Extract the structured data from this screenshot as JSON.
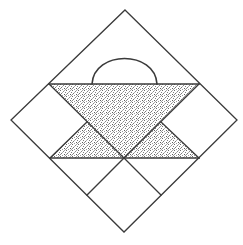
{
  "diagram": {
    "colors": {
      "line": "#3a3a3a",
      "shade_dot": "#6b6b6b",
      "background": "#ffffff"
    },
    "outer_diamond": {
      "top": [
        125,
        10
      ],
      "right": [
        237,
        120
      ],
      "bottom": [
        124,
        232
      ],
      "left": [
        11,
        120
      ]
    },
    "basket": {
      "top_band_y": 84,
      "bottom_band_y": 158,
      "band_left_x": 49,
      "band_right_x": 199,
      "center_bottom": [
        124,
        158
      ],
      "shaded_regions": [
        "inverted-triangle",
        "left-small-triangle",
        "right-small-triangle"
      ],
      "handle": {
        "shape": "semicircular-arc",
        "from": [
          92,
          84
        ],
        "to": [
          157,
          84
        ],
        "peak_y": 56
      }
    },
    "pieces": [
      "top-triangle-with-handle",
      "left-square",
      "right-square",
      "bottom-center-square",
      "bottom-left-triangle",
      "bottom-right-triangle"
    ]
  }
}
